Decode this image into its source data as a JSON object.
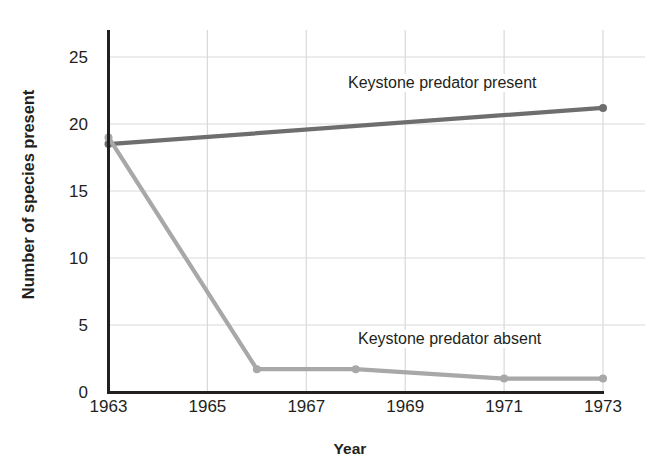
{
  "chart_data": {
    "type": "line",
    "title": "",
    "xlabel": "Year",
    "ylabel": "Number of species present",
    "xlim": [
      1963,
      1973
    ],
    "ylim": [
      0,
      26.5
    ],
    "xticks": [
      1963,
      1965,
      1967,
      1969,
      1971,
      1973
    ],
    "yticks": [
      0,
      5,
      10,
      15,
      20,
      25
    ],
    "grid": true,
    "legend_position": "inline-annotations",
    "series": [
      {
        "name": "Keystone predator present",
        "color": "#6e6e6e",
        "annotation": "Keystone predator present",
        "points": [
          {
            "x": 1963,
            "y": 18.5
          },
          {
            "x": 1973,
            "y": 21.2
          }
        ]
      },
      {
        "name": "Keystone predator absent",
        "color": "#a8a8a8",
        "annotation": "Keystone predator absent",
        "points": [
          {
            "x": 1963,
            "y": 19.0
          },
          {
            "x": 1966,
            "y": 1.7
          },
          {
            "x": 1968,
            "y": 1.7
          },
          {
            "x": 1971,
            "y": 1.0
          },
          {
            "x": 1973,
            "y": 1.0
          }
        ]
      }
    ]
  },
  "axes": {
    "y_title": "Number of species present",
    "x_title": "Year",
    "y_tick_labels": [
      "0",
      "5",
      "10",
      "15",
      "20",
      "25"
    ],
    "x_tick_labels": [
      "1963",
      "1965",
      "1967",
      "1969",
      "1971",
      "1973"
    ]
  },
  "colors": {
    "axis": "#231f20",
    "grid": "#d9d9d9",
    "series_present": "#6e6e6e",
    "series_absent": "#a8a8a8",
    "background": "#ffffff"
  }
}
